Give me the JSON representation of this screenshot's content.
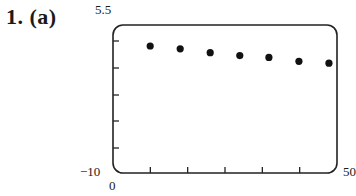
{
  "problem_label": "1. (a)",
  "axes": {
    "y_max_label": "5.5",
    "y_min_label": "−10",
    "x_min_label": "0",
    "x_max_label": "50"
  },
  "chart_data": {
    "type": "scatter",
    "title": "",
    "xlabel": "",
    "ylabel": "",
    "xlim": [
      0,
      50
    ],
    "ylim": [
      -10,
      5.5
    ],
    "grid": false,
    "x_ticks": 6,
    "y_ticks": 5,
    "series": [
      {
        "name": "data",
        "points": [
          {
            "x": 8.3,
            "y": 3.3
          },
          {
            "x": 15.0,
            "y": 3.0
          },
          {
            "x": 21.7,
            "y": 2.6
          },
          {
            "x": 28.3,
            "y": 2.3
          },
          {
            "x": 34.8,
            "y": 2.1
          },
          {
            "x": 41.5,
            "y": 1.7
          },
          {
            "x": 48.2,
            "y": 1.5
          }
        ]
      }
    ]
  }
}
